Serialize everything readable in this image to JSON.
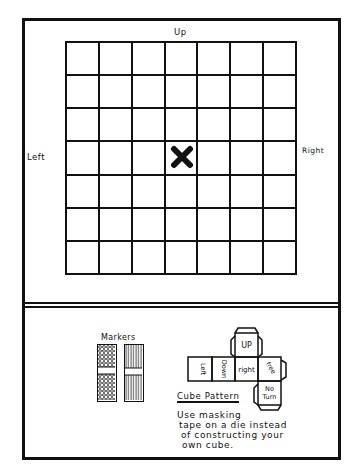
{
  "board": {
    "rows": 7,
    "columns": 7,
    "start_marker": "X",
    "start_cell": {
      "row": 3,
      "col": 3
    },
    "labels": {
      "top": "Up",
      "bottom": "Down",
      "left": "Left",
      "right": "Right"
    }
  },
  "markers": {
    "title": "Markers",
    "items": [
      {
        "pattern": "dotted"
      },
      {
        "pattern": "striped"
      }
    ]
  },
  "cube_pattern": {
    "title": "Cube Pattern",
    "faces": [
      "Up",
      "Left",
      "Down",
      "right",
      "free",
      "No Turn"
    ],
    "faces_display": {
      "up": "UP",
      "left": "Left",
      "down": "Down",
      "right": "right",
      "free": "free",
      "no_turn_1": "No",
      "no_turn_2": "Turn"
    }
  },
  "note": {
    "line1": "Use masking",
    "line2": "tape on a die instead",
    "line3": "of constructing your",
    "line4": "own cube."
  }
}
